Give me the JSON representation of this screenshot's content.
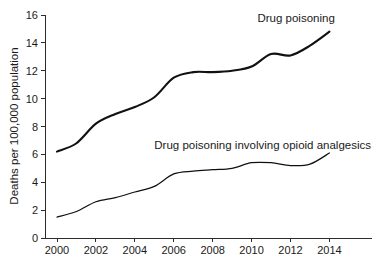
{
  "chart_data": {
    "type": "line",
    "title": "",
    "xlabel": "",
    "ylabel": "Deaths per 100,000 population",
    "x": [
      2000,
      2001,
      2002,
      2003,
      2004,
      2005,
      2006,
      2007,
      2008,
      2009,
      2010,
      2011,
      2012,
      2013,
      2014
    ],
    "xlim": [
      2000,
      2014.8
    ],
    "ylim": [
      0,
      16
    ],
    "xticks": [
      "2000",
      "2002",
      "2004",
      "2006",
      "2008",
      "2010",
      "2012",
      "2014"
    ],
    "xtick_values": [
      2000,
      2002,
      2004,
      2006,
      2008,
      2010,
      2012,
      2014
    ],
    "yticks": [
      "0",
      "2",
      "4",
      "6",
      "8",
      "10",
      "12",
      "14",
      "16"
    ],
    "ytick_values": [
      0,
      2,
      4,
      6,
      8,
      10,
      12,
      14,
      16
    ],
    "grid": false,
    "legend_position": "inline-annotation",
    "series": [
      {
        "name": "Drug poisoning",
        "label": "Drug poisoning",
        "color": "#111111",
        "values": [
          6.2,
          6.8,
          8.2,
          8.9,
          9.4,
          10.1,
          11.5,
          11.9,
          11.9,
          12.0,
          12.3,
          13.2,
          13.1,
          13.8,
          14.8
        ]
      },
      {
        "name": "Drug poisoning involving opioid analgesics",
        "label": "Drug poisoning involving opioid analgesics",
        "color": "#111111",
        "values": [
          1.5,
          1.9,
          2.6,
          2.9,
          3.3,
          3.7,
          4.6,
          4.8,
          4.9,
          5.0,
          5.4,
          5.4,
          5.2,
          5.3,
          6.1
        ]
      }
    ],
    "annotations": [
      {
        "text": "Drug poisoning",
        "x": 2010.3,
        "y": 15.5
      },
      {
        "text": "Drug poisoning involving opioid analgesics",
        "x": 2005.0,
        "y": 6.4
      }
    ]
  }
}
